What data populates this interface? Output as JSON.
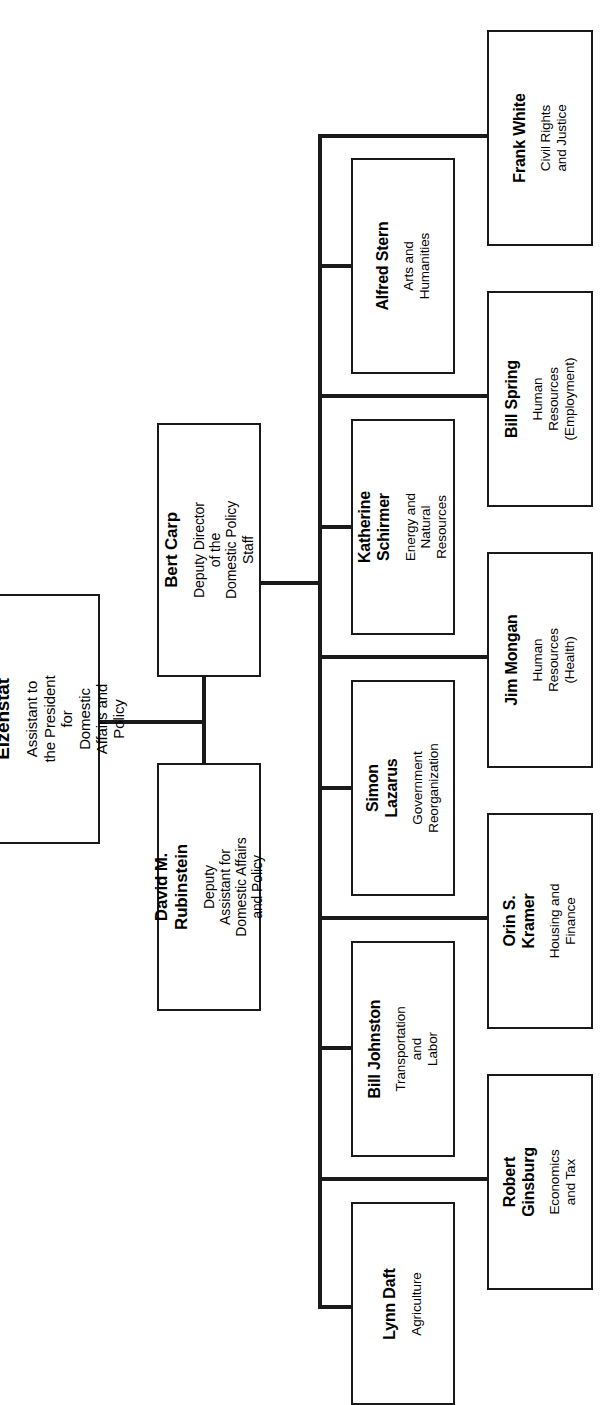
{
  "chart_title": "Domestic Policy Staff Organization Chart",
  "orientation": "rotated-90-ccw",
  "root": {
    "name": "Stuart E. Eizenstat",
    "role": "Assistant to the President for\nDomestic Affairs and Policy"
  },
  "deputies": [
    {
      "name": "Bert Carp",
      "role": "Deputy Director of the\nDomestic Policy Staff"
    },
    {
      "name": "David M. Rubinstein",
      "role": "Deputy Assistant for\nDomestic Affairs and Policy"
    }
  ],
  "staff_inner": [
    {
      "name": "Alfred Stern",
      "role": "Arts and\nHumanities"
    },
    {
      "name": "Katherine Schirmer",
      "role": "Energy and\nNatural Resources"
    },
    {
      "name": "Simon Lazarus",
      "role": "Government\nReorganization"
    },
    {
      "name": "Bill Johnston",
      "role": "Transportation and\nLabor"
    },
    {
      "name": "Lynn Daft",
      "role": "Agriculture"
    }
  ],
  "staff_outer": [
    {
      "name": "Frank White",
      "role": "Civil Rights\nand Justice"
    },
    {
      "name": "Bill Spring",
      "role": "Human Resources\n(Employment)"
    },
    {
      "name": "Jim Mongan",
      "role": "Human Resources\n(Health)"
    },
    {
      "name": "Orin S. Kramer",
      "role": "Housing and\nFinance"
    },
    {
      "name": "Robert Ginsburg",
      "role": "Economics\nand Tax"
    }
  ],
  "colors": {
    "line": "#1a1a1a",
    "background": "#ffffff",
    "text": "#000000"
  }
}
